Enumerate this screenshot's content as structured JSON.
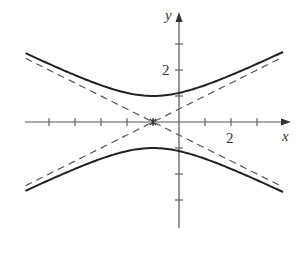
{
  "chart_data": {
    "type": "line",
    "title": "",
    "xlabel": "x",
    "ylabel": "y",
    "equation": "y^2 - (x+1)^2/4 = 1",
    "center": [
      -1,
      0
    ],
    "xlim": [
      -6,
      4.5
    ],
    "ylim": [
      -4.1,
      4.2
    ],
    "x_tick_labels": [
      {
        "value": 2,
        "label": "2"
      }
    ],
    "y_tick_labels": [
      {
        "value": 2,
        "label": "2"
      }
    ],
    "x_ticks": [
      -5,
      -4,
      -3,
      -2,
      -1,
      1,
      2,
      3
    ],
    "y_ticks": [
      3,
      2,
      1,
      -1,
      -2,
      -3
    ],
    "grid": false,
    "legend": null,
    "series": [
      {
        "name": "hyperbola-upper-branch",
        "style": "solid",
        "x_range": [
          -5.9,
          4.0
        ],
        "formula": "y = sqrt(1 + (x+1)^2/4)"
      },
      {
        "name": "hyperbola-lower-branch",
        "style": "solid",
        "x_range": [
          -5.9,
          4.0
        ],
        "formula": "y = -sqrt(1 + (x+1)^2/4)"
      },
      {
        "name": "asymptote-rising",
        "style": "dashed",
        "x_range": [
          -5.9,
          4.0
        ],
        "formula": "y = (x+1)/2"
      },
      {
        "name": "asymptote-falling",
        "style": "dashed",
        "x_range": [
          -5.9,
          4.0
        ],
        "formula": "y = -(x+1)/2"
      }
    ],
    "layout": {
      "origin_px": [
        179,
        122
      ],
      "unit_px": 26,
      "x_axis_px": [
        25,
        291
      ],
      "y_axis_px": [
        12,
        228
      ]
    },
    "colors": {
      "curve": "#222222",
      "asymptote": "#555555",
      "axis": "#555555"
    }
  },
  "labels": {
    "x_axis": "x",
    "y_axis": "y",
    "x_tick_2": "2",
    "y_tick_2": "2"
  }
}
